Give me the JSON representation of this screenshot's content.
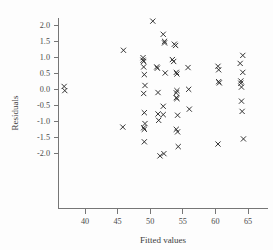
{
  "chart_data": {
    "type": "scatter",
    "title": "",
    "xlabel": "Fitted values",
    "ylabel": "Residuals",
    "xlim": [
      35.2,
      67.0
    ],
    "ylim": [
      -2.35,
      2.35
    ],
    "xticks": [
      40,
      45,
      50,
      55,
      60,
      65
    ],
    "xticklabels": [
      "40",
      "45",
      "50",
      "55",
      "60",
      "65"
    ],
    "yticks": [
      -2.0,
      -1.5,
      -1.0,
      -0.5,
      0.0,
      0.5,
      1.0,
      1.5,
      2.0
    ],
    "yticklabels": [
      "-2.0",
      "-1.5",
      "-1.0",
      "-0.5",
      "0.0",
      "0.5",
      "1.0",
      "1.5",
      "2.0"
    ],
    "grid": false,
    "legend": false,
    "marker": "x",
    "marker_color": "#2a2a2a",
    "points": [
      [
        36.8,
        0.08
      ],
      [
        36.9,
        -0.05
      ],
      [
        45.9,
        1.21
      ],
      [
        45.8,
        -1.19
      ],
      [
        48.9,
        0.98
      ],
      [
        48.9,
        0.9
      ],
      [
        49.0,
        0.86
      ],
      [
        49.0,
        0.69
      ],
      [
        49.1,
        0.45
      ],
      [
        49.2,
        0.11
      ],
      [
        49.0,
        -0.14
      ],
      [
        49.1,
        -0.74
      ],
      [
        49.2,
        -1.08
      ],
      [
        49.0,
        -1.21
      ],
      [
        49.1,
        -1.26
      ],
      [
        49.1,
        -1.65
      ],
      [
        50.4,
        2.12
      ],
      [
        51.0,
        0.69
      ],
      [
        51.1,
        0.65
      ],
      [
        51.2,
        -0.11
      ],
      [
        51.2,
        -0.78
      ],
      [
        51.3,
        -0.98
      ],
      [
        51.5,
        -2.09
      ],
      [
        52.0,
        1.71
      ],
      [
        52.2,
        1.49
      ],
      [
        52.2,
        1.44
      ],
      [
        52.3,
        0.5
      ],
      [
        52.0,
        -0.54
      ],
      [
        52.0,
        -0.8
      ],
      [
        52.1,
        -2.02
      ],
      [
        53.4,
        0.92
      ],
      [
        53.6,
        0.86
      ],
      [
        53.7,
        1.4
      ],
      [
        53.9,
        1.36
      ],
      [
        54.0,
        0.52
      ],
      [
        54.1,
        0.47
      ],
      [
        54.1,
        -0.05
      ],
      [
        54.0,
        -0.12
      ],
      [
        54.0,
        -0.27
      ],
      [
        54.1,
        -0.3
      ],
      [
        54.2,
        -0.82
      ],
      [
        54.0,
        -1.26
      ],
      [
        54.2,
        -1.34
      ],
      [
        54.3,
        -1.8
      ],
      [
        55.8,
        0.67
      ],
      [
        55.9,
        -0.01
      ],
      [
        56.0,
        -0.63
      ],
      [
        60.4,
        0.71
      ],
      [
        60.5,
        0.6
      ],
      [
        60.5,
        0.23
      ],
      [
        60.6,
        0.19
      ],
      [
        60.4,
        -1.72
      ],
      [
        63.8,
        0.8
      ],
      [
        63.9,
        0.25
      ],
      [
        63.9,
        0.18
      ],
      [
        64.0,
        0.06
      ],
      [
        64.0,
        -0.38
      ],
      [
        64.1,
        -0.7
      ],
      [
        64.2,
        1.05
      ],
      [
        64.2,
        0.52
      ],
      [
        64.3,
        -1.56
      ]
    ]
  },
  "axes": {
    "x_title": "Fitted values",
    "y_title": "Residuals"
  }
}
